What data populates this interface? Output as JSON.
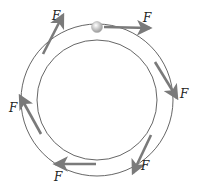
{
  "diagram": {
    "colors": {
      "track": "#555555",
      "arrow": "#7a7a7a",
      "ball": "#cfcfcf",
      "label": "#222222"
    },
    "track": {
      "center": [
        97,
        100
      ],
      "outer_radius": 76,
      "inner_radius": 60
    },
    "ball": {
      "x": 97,
      "y": 27,
      "r": 5
    },
    "arrows": [
      {
        "id": "top",
        "x1": 104,
        "y1": 27,
        "x2": 150,
        "y2": 28,
        "label": "F",
        "lx": 143,
        "ly": 22
      },
      {
        "id": "upper-right",
        "x1": 155,
        "y1": 62,
        "x2": 177,
        "y2": 98,
        "label": "F",
        "lx": 180,
        "ly": 98
      },
      {
        "id": "lower-right",
        "x1": 151,
        "y1": 135,
        "x2": 133,
        "y2": 173,
        "label": "F",
        "lx": 141,
        "ly": 170
      },
      {
        "id": "bottom",
        "x1": 96,
        "y1": 164,
        "x2": 55,
        "y2": 164,
        "label": "F",
        "lx": 54,
        "ly": 181
      },
      {
        "id": "left",
        "x1": 41,
        "y1": 134,
        "x2": 20,
        "y2": 96,
        "label": "F",
        "lx": 9,
        "ly": 112
      },
      {
        "id": "upper-left",
        "x1": 43,
        "y1": 54,
        "x2": 63,
        "y2": 15,
        "label": "F",
        "lx": 52,
        "ly": 20
      }
    ]
  }
}
